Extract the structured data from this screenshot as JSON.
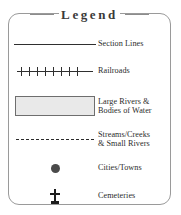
{
  "legend": {
    "title": "Legend",
    "frame": {
      "border_color": "#9a9a9a",
      "background": "#ffffff"
    },
    "entries": [
      {
        "id": "section-lines",
        "symbol": "solid-line",
        "label": "Section Lines",
        "color": "#2f2f2f"
      },
      {
        "id": "railroads",
        "symbol": "railroad-line",
        "label": "Railroads",
        "color": "#2f2f2f",
        "tie_count": 8
      },
      {
        "id": "large-rivers",
        "symbol": "filled-rectangle",
        "label": "Large Rivers &\nBodies of Water",
        "fill_color": "#e9e9e9",
        "border_color": "#6e6e6e"
      },
      {
        "id": "streams-creeks",
        "symbol": "dashed-line",
        "label": "Streams/Creeks\n& Small Rivers",
        "color": "#2b2b2b"
      },
      {
        "id": "cities-towns",
        "symbol": "filled-circle",
        "label": "Cities/Towns",
        "color": "#4a4a4a"
      },
      {
        "id": "cemeteries",
        "symbol": "cross-dagger",
        "label": "Cemeteries",
        "color": "#1d1d1d"
      }
    ]
  }
}
